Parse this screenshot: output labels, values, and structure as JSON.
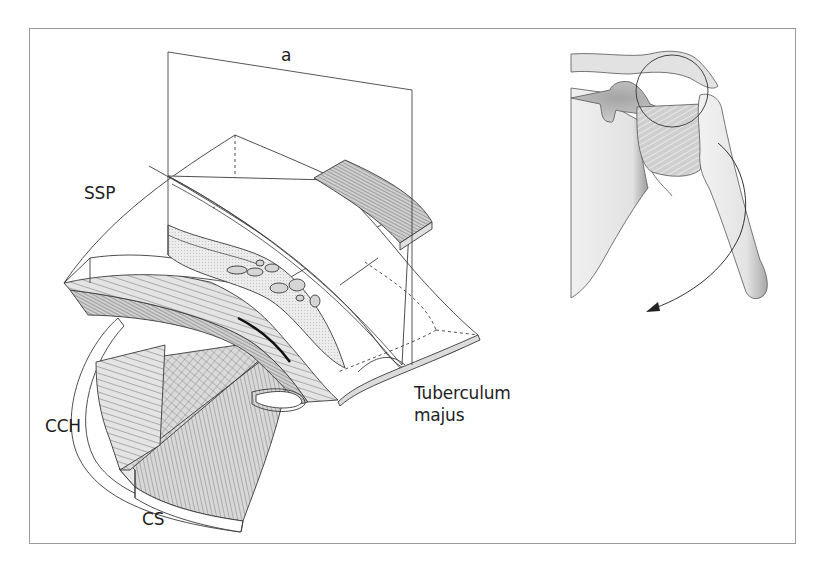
{
  "figure": {
    "type": "anatomical-illustration",
    "colors": {
      "line": "#3a3a3a",
      "frame": "#9a9a9a",
      "fill_light": "#e6e6e6",
      "fill_mid": "#c8c8c8",
      "fill_dark": "#8a8a8a",
      "background": "#ffffff"
    }
  },
  "labels": {
    "plane": "a",
    "ssp": "SSP",
    "cch": "CCH",
    "cs": "CS",
    "tuberculum_line1": "Tuberculum",
    "tuberculum_line2": "majus"
  },
  "panels": [
    {
      "name": "left",
      "description": "schematic cut through rotator cuff tendons with section plane a"
    },
    {
      "name": "right",
      "description": "shoulder overview with magnified circle and rotation arrow"
    }
  ]
}
